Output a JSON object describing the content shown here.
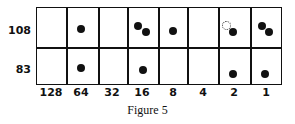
{
  "figure": {
    "caption": "Figure 5",
    "rows": [
      {
        "label": "108",
        "dots_per_column": [
          0,
          1,
          2,
          1,
          0,
          1,
          2,
          0
        ],
        "note": "column 2 contains an additional dotted (ghost) circle"
      },
      {
        "label": "83",
        "dots_per_column": [
          0,
          1,
          0,
          1,
          0,
          0,
          1,
          1
        ]
      }
    ],
    "columns": [
      "128",
      "64",
      "32",
      "16",
      "8",
      "4",
      "2",
      "1"
    ]
  }
}
